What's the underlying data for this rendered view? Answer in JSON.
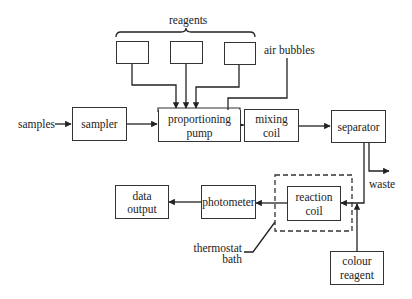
{
  "diagram": {
    "type": "flow-diagram",
    "labels": {
      "reagents": "reagents",
      "air_bubbles": "air bubbles",
      "samples": "samples",
      "waste": "waste",
      "thermostat_line1": "thermostat",
      "thermostat_line2": "bath"
    },
    "boxes": {
      "sampler": {
        "line1": "sampler"
      },
      "pump": {
        "line1": "proportioning",
        "line2": "pump"
      },
      "mixing": {
        "line1": "mixing",
        "line2": "coil"
      },
      "separator": {
        "line1": "separator"
      },
      "reaction": {
        "line1": "reaction",
        "line2": "coil"
      },
      "photometer": {
        "line1": "photometer"
      },
      "data_output": {
        "line1": "data",
        "line2": "output"
      },
      "colour_reagent": {
        "line1": "colour",
        "line2": "reagent"
      }
    },
    "reagent_boxes": 3,
    "connections": [
      [
        "samples",
        "sampler"
      ],
      [
        "sampler",
        "proportioning pump"
      ],
      [
        "reagent 1",
        "proportioning pump"
      ],
      [
        "reagent 2",
        "proportioning pump"
      ],
      [
        "reagent 3",
        "proportioning pump"
      ],
      [
        "air bubbles",
        "pump output line"
      ],
      [
        "proportioning pump",
        "mixing coil"
      ],
      [
        "mixing coil",
        "separator"
      ],
      [
        "separator",
        "waste"
      ],
      [
        "separator",
        "reaction coil"
      ],
      [
        "colour reagent",
        "reaction coil"
      ],
      [
        "reaction coil",
        "photometer"
      ],
      [
        "photometer",
        "data output"
      ],
      [
        "thermostat bath",
        "reaction coil enclosure"
      ]
    ]
  }
}
